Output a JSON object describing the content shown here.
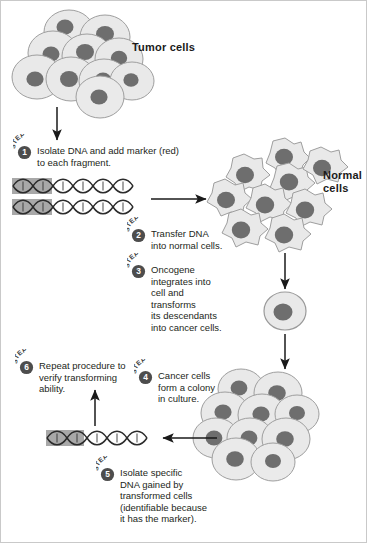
{
  "figure": {
    "background_color": "#ffffff",
    "border_color": "#c9c9c9"
  },
  "labels": {
    "tumor_cells": "Tumor cells",
    "normal_cells": "Normal\ncells"
  },
  "step_word": "STEP",
  "steps": [
    {
      "number": "1",
      "text": "Isolate DNA and add marker (red)\nto each fragment."
    },
    {
      "number": "2",
      "text": "Transfer DNA\ninto normal cells."
    },
    {
      "number": "3",
      "text": "Oncogene\nintegrates into\ncell and\ntransforms\nits descendants\ninto cancer cells."
    },
    {
      "number": "4",
      "text": "Cancer cells\nform a colony\nin culture."
    },
    {
      "number": "5",
      "text": "Isolate specific\nDNA gained by\ntransformed cells\n(identifiable because\nit has the marker)."
    },
    {
      "number": "6",
      "text": "Repeat procedure to\nverify transforming\nability."
    }
  ],
  "colors": {
    "cell_fill": "#e9e9e9",
    "cell_stroke": "#9a9a9a",
    "nucleus_fill": "#6e6e6e",
    "nucleus_stroke": "#5d5d5d",
    "dna_stroke": "#2b2b2b",
    "marker_fill": "#a8a8a8",
    "arrow_color": "#1a1a1a",
    "badge_fill": "#4d4d4d",
    "badge_text": "#ffffff",
    "text_color": "#231f20"
  },
  "structures": {
    "tumor_cell_cluster": {
      "name": "tumor-cell-cluster",
      "cell_count": 11,
      "shape": "round"
    },
    "normal_cell_cluster": {
      "name": "normal-cell-cluster",
      "cell_count": 9,
      "shape": "irregular-polygon"
    },
    "transformed_cell": {
      "name": "single-transformed-cell",
      "cell_count": 1,
      "shape": "round"
    },
    "cancer_colony": {
      "name": "cancer-cell-colony",
      "cell_count": 10,
      "shape": "round"
    },
    "dna_top": {
      "name": "dna-fragments-marked",
      "strand_count": 2,
      "marker_label": "red marker region"
    },
    "dna_bottom": {
      "name": "dna-fragment-recovered",
      "strand_count": 1,
      "marker_label": "red marker region"
    }
  },
  "arrows": [
    {
      "name": "arrow-tumor-to-dna",
      "direction": "down"
    },
    {
      "name": "arrow-dna-to-normal-cells",
      "direction": "right"
    },
    {
      "name": "arrow-normal-cells-to-transformed-cell",
      "direction": "down"
    },
    {
      "name": "arrow-transformed-cell-to-colony",
      "direction": "down"
    },
    {
      "name": "arrow-colony-to-dna",
      "direction": "left"
    },
    {
      "name": "arrow-dna-to-repeat",
      "direction": "up"
    }
  ]
}
